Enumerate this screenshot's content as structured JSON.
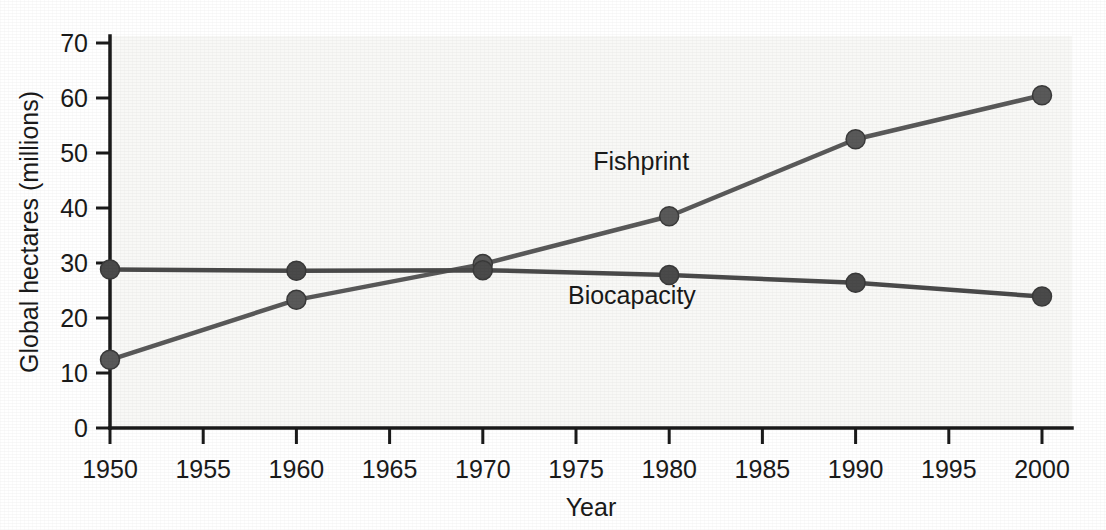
{
  "chart_data": {
    "type": "line",
    "title": "",
    "subtitle": "",
    "xlabel": "Year",
    "ylabel": "Global hectares (millions)",
    "x": [
      1950,
      1960,
      1970,
      1980,
      1990,
      2000
    ],
    "xlim": [
      1950,
      2000
    ],
    "ylim": [
      0,
      70
    ],
    "xticks": [
      1950,
      1955,
      1960,
      1965,
      1970,
      1975,
      1980,
      1985,
      1990,
      1995,
      2000
    ],
    "xticklabels": [
      "1950",
      "1955",
      "1960",
      "1965",
      "1970",
      "1975",
      "1980",
      "1985",
      "1990",
      "1995",
      "2000"
    ],
    "yticks": [
      0,
      10,
      20,
      30,
      40,
      50,
      60,
      70
    ],
    "yticklabels": [
      "0",
      "10",
      "20",
      "30",
      "40",
      "50",
      "60",
      "70"
    ],
    "grid": false,
    "legend_position": "inline-annotations",
    "series": [
      {
        "name": "Fishprint",
        "color": "#595959",
        "marker": "circle",
        "values": [
          12.4,
          23.3,
          29.8,
          38.5,
          52.5,
          60.5
        ],
        "label_x": 1978.5,
        "label_y": 47.0
      },
      {
        "name": "Biocapacity",
        "color": "#4a4a4a",
        "marker": "circle",
        "values": [
          28.8,
          28.6,
          28.7,
          27.8,
          26.4,
          23.9
        ],
        "label_x": 1978.0,
        "label_y": 22.5
      }
    ],
    "annotations": [
      {
        "text": "Fishprint",
        "x": 1978.5,
        "y": 47.0
      },
      {
        "text": "Biocapacity",
        "x": 1978.0,
        "y": 22.5
      }
    ],
    "colors": {
      "axis": "#1a1a1a",
      "text": "#1a1a1a",
      "plot_background": "#f8f8f6",
      "page_background": "#ffffff",
      "fishprint": "#595959",
      "biocapacity": "#4a4a4a"
    }
  }
}
